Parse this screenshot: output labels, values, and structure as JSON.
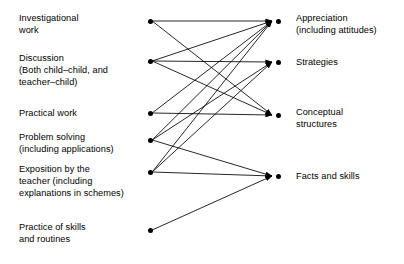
{
  "diagram": {
    "width": 404,
    "height": 264,
    "background_color": "#ffffff",
    "line_color": "#000000",
    "node_color": "#000000",
    "left_column": {
      "node_x": 150,
      "label_x": 19,
      "nodes": [
        {
          "id": "investigational-work",
          "label": "Investigational\nwork",
          "x": 150,
          "y": 21,
          "label_y": 12
        },
        {
          "id": "discussion",
          "label": "Discussion\n(Both child–child, and\nteacher–child)",
          "x": 150,
          "y": 61,
          "label_y": 52
        },
        {
          "id": "practical-work",
          "label": "Practical work",
          "x": 150,
          "y": 113,
          "label_y": 107
        },
        {
          "id": "problem-solving",
          "label": "Problem solving\n(including applications)",
          "x": 150,
          "y": 140,
          "label_y": 131
        },
        {
          "id": "exposition-by-teacher",
          "label": "Exposition by the\nteacher (including\nexplanations in schemes)",
          "x": 150,
          "y": 172,
          "label_y": 163
        },
        {
          "id": "practice-of-skills",
          "label": "Practice of skills\nand routines",
          "x": 150,
          "y": 230,
          "label_y": 221
        }
      ]
    },
    "right_column": {
      "node_x": 278,
      "label_x": 296,
      "arrow_tip_x": 272,
      "nodes": [
        {
          "id": "appreciation",
          "label": "Appreciation\n(including attitudes)",
          "x": 278,
          "y": 21,
          "label_y": 12
        },
        {
          "id": "strategies",
          "label": "Strategies",
          "x": 278,
          "y": 62,
          "label_y": 56
        },
        {
          "id": "conceptual-structures",
          "label": "Conceptual\nstructures",
          "x": 278,
          "y": 115,
          "label_y": 106
        },
        {
          "id": "facts-and-skills",
          "label": "Facts and skills",
          "x": 278,
          "y": 176,
          "label_y": 170
        }
      ]
    },
    "edges": [
      {
        "from": "investigational-work",
        "to": "appreciation"
      },
      {
        "from": "investigational-work",
        "to": "conceptual-structures"
      },
      {
        "from": "discussion",
        "to": "appreciation"
      },
      {
        "from": "discussion",
        "to": "strategies"
      },
      {
        "from": "discussion",
        "to": "conceptual-structures"
      },
      {
        "from": "practical-work",
        "to": "appreciation"
      },
      {
        "from": "practical-work",
        "to": "conceptual-structures"
      },
      {
        "from": "problem-solving",
        "to": "appreciation"
      },
      {
        "from": "problem-solving",
        "to": "strategies"
      },
      {
        "from": "problem-solving",
        "to": "facts-and-skills"
      },
      {
        "from": "exposition-by-teacher",
        "to": "appreciation"
      },
      {
        "from": "exposition-by-teacher",
        "to": "strategies"
      },
      {
        "from": "exposition-by-teacher",
        "to": "facts-and-skills"
      },
      {
        "from": "practice-of-skills",
        "to": "facts-and-skills"
      }
    ]
  }
}
